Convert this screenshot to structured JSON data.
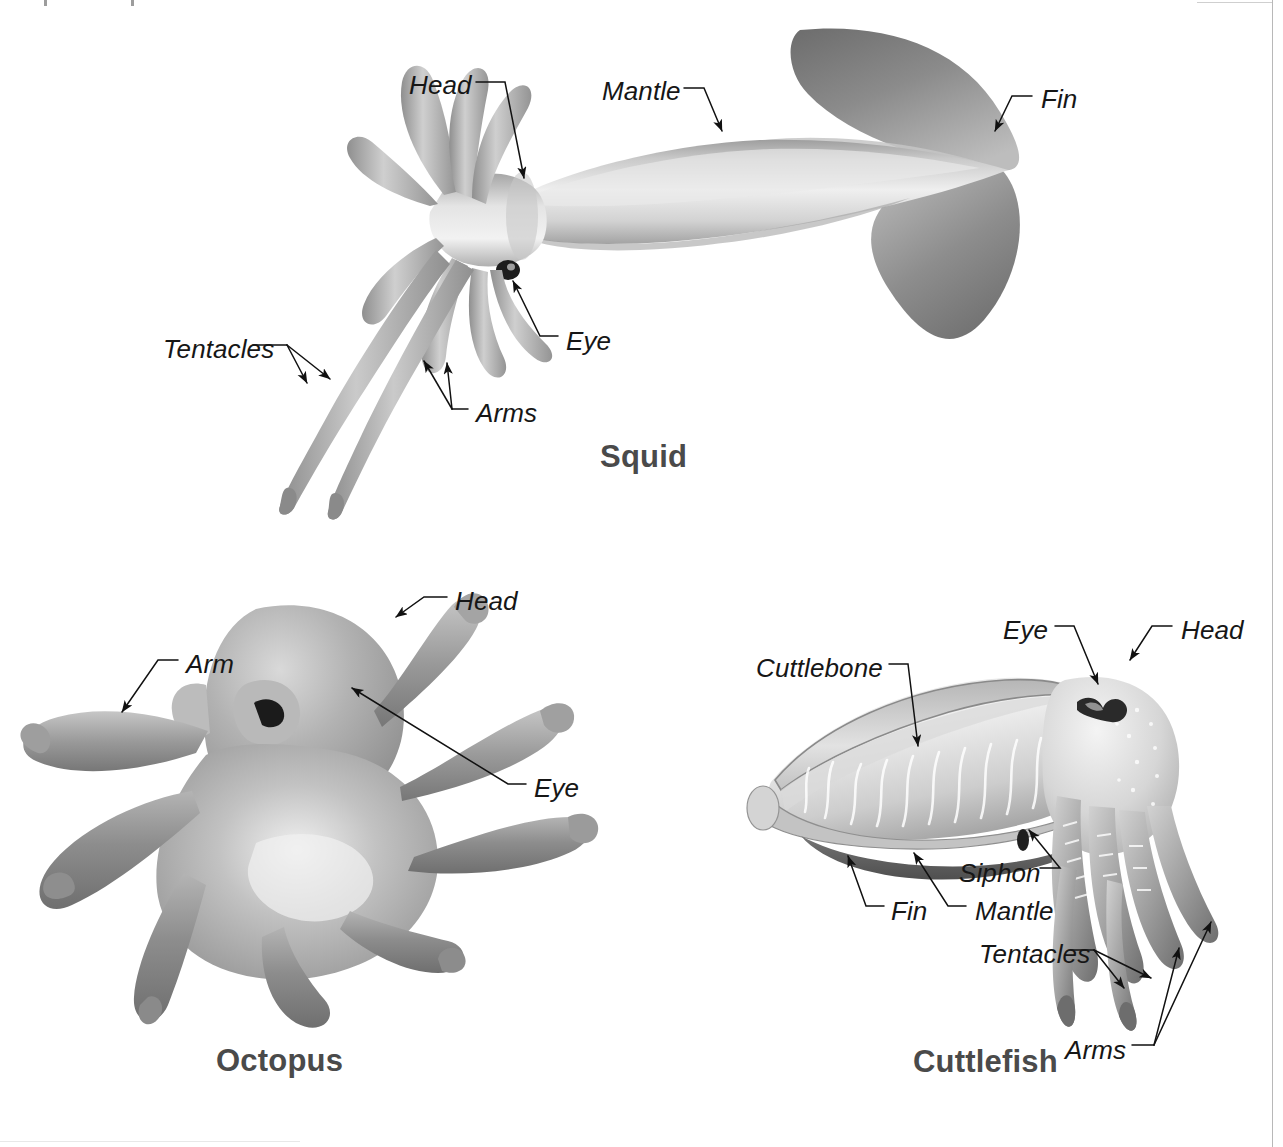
{
  "figure": {
    "type": "labeled-anatomy-diagram",
    "style": "grayscale airbrush illustration with italic leader labels",
    "background_color": "#ffffff",
    "label_color": "#161616",
    "caption_color": "#4a4a4a"
  },
  "specimens": [
    {
      "id": "squid",
      "caption": "Squid",
      "caption_pos": {
        "x": 600,
        "y": 441
      },
      "labels": [
        {
          "key": "head",
          "text": "Head",
          "x": 409,
          "y": 72
        },
        {
          "key": "mantle",
          "text": "Mantle",
          "x": 602,
          "y": 78
        },
        {
          "key": "fin",
          "text": "Fin",
          "x": 1041,
          "y": 86
        },
        {
          "key": "eye",
          "text": "Eye",
          "x": 566,
          "y": 328
        },
        {
          "key": "tentacles",
          "text": "Tentacles",
          "x": 163,
          "y": 336
        },
        {
          "key": "arms",
          "text": "Arms",
          "x": 476,
          "y": 400
        }
      ]
    },
    {
      "id": "octopus",
      "caption": "Octopus",
      "caption_pos": {
        "x": 216,
        "y": 1045
      },
      "labels": [
        {
          "key": "head",
          "text": "Head",
          "x": 455,
          "y": 588
        },
        {
          "key": "arm",
          "text": "Arm",
          "x": 186,
          "y": 651
        },
        {
          "key": "eye",
          "text": "Eye",
          "x": 534,
          "y": 775
        }
      ]
    },
    {
      "id": "cuttlefish",
      "caption": "Cuttlefish",
      "caption_pos": {
        "x": 913,
        "y": 1046
      },
      "labels": [
        {
          "key": "eye",
          "text": "Eye",
          "x": 1003,
          "y": 617
        },
        {
          "key": "head",
          "text": "Head",
          "x": 1181,
          "y": 617
        },
        {
          "key": "cuttlebone",
          "text": "Cuttlebone",
          "x": 756,
          "y": 655
        },
        {
          "key": "siphon",
          "text": "Siphon",
          "x": 959,
          "y": 860
        },
        {
          "key": "fin",
          "text": "Fin",
          "x": 891,
          "y": 898
        },
        {
          "key": "mantle",
          "text": "Mantle",
          "x": 975,
          "y": 898
        },
        {
          "key": "tentacles",
          "text": "Tentacles",
          "x": 979,
          "y": 941
        },
        {
          "key": "arms",
          "text": "Arms",
          "x": 1065,
          "y": 1037
        }
      ]
    }
  ]
}
